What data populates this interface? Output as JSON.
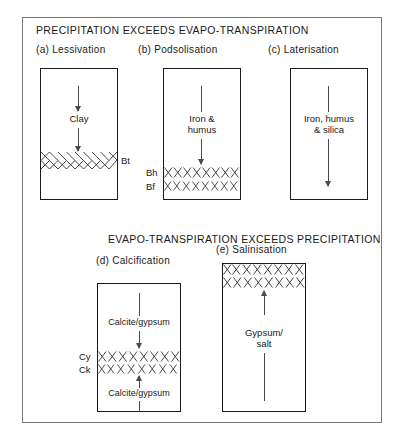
{
  "figure": {
    "sections": [
      {
        "id": "top",
        "heading": "PRECIPITATION EXCEEDS  EVAPO-TRANSPIRATION"
      },
      {
        "id": "bottom",
        "heading": "EVAPO-TRANSPIRATION EXCEEDS PRECIPITATION"
      }
    ],
    "panels": [
      {
        "key": "a",
        "caption": "(a)  Lessivation",
        "process_label": "Clay",
        "horizon_labels": [
          "Bt"
        ],
        "arrow_direction": "down"
      },
      {
        "key": "b",
        "caption": "(b) Podsolisation",
        "process_label_line1": "Iron &",
        "process_label_line2": "humus",
        "horizon_labels": [
          "Bh",
          "Bf"
        ],
        "arrow_direction": "down"
      },
      {
        "key": "c",
        "caption": "(c)  Laterisation",
        "process_label_line1": "Iron, humus",
        "process_label_line2": "& silica",
        "horizon_labels": [],
        "arrow_direction": "down"
      },
      {
        "key": "d",
        "caption": "(d) Calcification",
        "process_label_top": "Calcite/gypsum",
        "process_label_bottom": "Calcite/gypsum",
        "horizon_labels": [
          "Cy",
          "Ck"
        ],
        "arrow_direction": "both"
      },
      {
        "key": "e",
        "caption": "(e)  Salinisation",
        "process_label_line1": "Gypsum/",
        "process_label_line2": "salt",
        "horizon_labels": [],
        "arrow_direction": "up"
      }
    ],
    "colors": {
      "frame": "#777777",
      "box_outline": "#1a1a1a",
      "arrow": "#4a4a4a",
      "text": "#1a1a1a",
      "hatch": "#333333",
      "background": "#ffffff"
    }
  }
}
